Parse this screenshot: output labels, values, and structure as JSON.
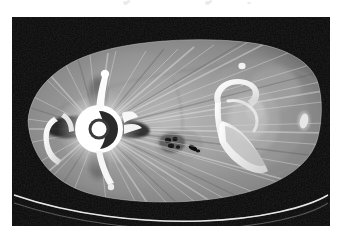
{
  "image": {
    "kind": "medical-ct-axial-slice",
    "modality_label": "CT",
    "body_region": "pelvis",
    "window": "bone-soft-tissue",
    "background_color": "#050505",
    "page_background_color": "#ffffff",
    "frame": {
      "left": 12,
      "top": 17,
      "width": 318,
      "height": 209
    },
    "annotations_present": "none",
    "overlay_text": "",
    "findings": [
      {
        "name": "metallic-hip-prosthesis",
        "side": "left-of-image",
        "description": "High-density metal implant with ring/cup configuration",
        "intensity": "#ffffff"
      },
      {
        "name": "streak-artifact",
        "description": "Radiating beam-hardening streaks from metal implant",
        "intensity": "#cfcfcf"
      },
      {
        "name": "pelvic-bone",
        "description": "Ischium and pubic ramus cortical bone, right side of image",
        "intensity": "#f2f2f2"
      },
      {
        "name": "bowel-gas",
        "description": "Rounded structure with dark gas foci, central-lower",
        "intensity": "#1a1a1a"
      },
      {
        "name": "calcification",
        "description": "Small bright focus in right lateral soft tissue",
        "intensity": "#f0f0f0"
      },
      {
        "name": "ct-table",
        "description": "Thin bright curved line along lower border of scan field",
        "intensity": "#e8e8e8"
      }
    ],
    "residue_marks": [
      {
        "x": 123,
        "y": 1,
        "w": 5,
        "h": 4
      },
      {
        "x": 127,
        "y": 0,
        "w": 3,
        "h": 3
      },
      {
        "x": 205,
        "y": 1,
        "w": 5,
        "h": 4
      },
      {
        "x": 209,
        "y": 0,
        "w": 3,
        "h": 3
      },
      {
        "x": 247,
        "y": 2,
        "w": 4,
        "h": 2
      }
    ]
  }
}
